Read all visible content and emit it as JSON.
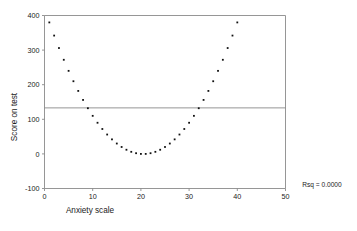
{
  "chart_data": {
    "type": "scatter",
    "title": "",
    "xlabel": "Anxiety scale",
    "ylabel": "Score on test",
    "xlim": [
      0,
      50
    ],
    "ylim": [
      -100,
      400
    ],
    "xticks": [
      0,
      10,
      20,
      30,
      40,
      50
    ],
    "yticks": [
      -100,
      0,
      100,
      200,
      300,
      400
    ],
    "xtick_labels": [
      "0",
      "10",
      "20",
      "30",
      "40",
      "50"
    ],
    "ytick_labels": [
      "-100",
      "0",
      "100",
      "200",
      "300",
      "400"
    ],
    "grid": false,
    "legend": null,
    "annotations": [
      {
        "name": "rsq",
        "text": "Rsq = 0.0000",
        "x": 51.5,
        "y": -95
      }
    ],
    "reference_lines": [
      {
        "name": "regression-line",
        "orientation": "horizontal",
        "y": 133,
        "label": ""
      }
    ],
    "series": [
      {
        "name": "Score on test",
        "marker": "square",
        "color": "#111111",
        "x": [
          1,
          2,
          3,
          4,
          5,
          6,
          7,
          8,
          9,
          10,
          11,
          12,
          13,
          14,
          15,
          16,
          17,
          18,
          19,
          20,
          21,
          22,
          23,
          24,
          25,
          26,
          27,
          28,
          29,
          30,
          31,
          32,
          33,
          34,
          35,
          36,
          37,
          38,
          39,
          40
        ],
        "y": [
          380,
          342,
          306,
          272,
          240,
          210,
          182,
          156,
          132,
          110,
          90,
          72,
          56,
          42,
          30,
          20,
          12,
          6,
          2,
          0,
          0,
          2,
          6,
          12,
          20,
          30,
          42,
          56,
          72,
          90,
          110,
          132,
          156,
          182,
          210,
          240,
          272,
          306,
          342,
          380
        ]
      }
    ]
  },
  "axis_titles": {
    "x": "Anxiety scale",
    "y": "Score on test"
  },
  "rsq_label": "Rsq = 0.0000"
}
